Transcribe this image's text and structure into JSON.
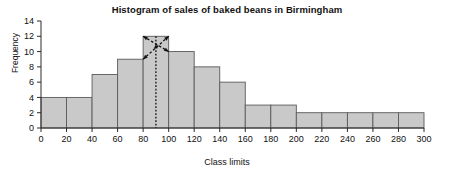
{
  "chart_data": {
    "type": "bar",
    "title": "Histogram of sales of baked beans in Birmingham",
    "xlabel": "Class limits",
    "ylabel": "Frequency",
    "xlim": [
      0,
      300
    ],
    "ylim": [
      0,
      14
    ],
    "bin_width": 20,
    "grid": false,
    "legend": null,
    "xticks": [
      0,
      20,
      40,
      60,
      80,
      100,
      120,
      140,
      160,
      180,
      200,
      220,
      240,
      260,
      280,
      300
    ],
    "yticks": [
      0,
      2,
      4,
      6,
      8,
      10,
      12,
      14
    ],
    "categories": [
      "0-20",
      "20-40",
      "40-60",
      "60-80",
      "80-100",
      "100-120",
      "120-140",
      "140-160",
      "160-180",
      "180-200",
      "200-220",
      "220-240",
      "240-260",
      "260-280",
      "280-300"
    ],
    "bin_edges": [
      0,
      20,
      40,
      60,
      80,
      100,
      120,
      140,
      160,
      180,
      200,
      220,
      240,
      260,
      280,
      300
    ],
    "values": [
      4,
      4,
      7,
      9,
      12,
      10,
      8,
      6,
      3,
      3,
      2,
      2,
      2,
      2,
      2
    ],
    "annotations": [
      {
        "name": "mode-marker",
        "type": "dotted-vertical-line",
        "x": 90,
        "y_from": 0,
        "y_to": 12,
        "description": "Dotted vertical line dropping from the modal bar to the horizontal axis"
      },
      {
        "name": "mode-construction-arrows",
        "type": "dashed-crossing-arrows",
        "bin": "80-100",
        "description": "Dashed diagonal construction lines with arrowheads crossing inside the tallest bar"
      }
    ],
    "bar_fill_color": "#c9c9c9",
    "bar_edge_color": "#5a5a5a",
    "axis_color": "#2b2b2b",
    "annotation_color": "#111111"
  }
}
